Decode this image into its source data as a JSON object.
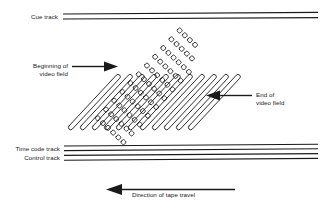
{
  "figure": {
    "type": "diagram",
    "background_color": "#ffffff",
    "line_color": "#1a1a1a"
  },
  "labels": {
    "cue_track": "Cue track",
    "beginning_of_video_field_line1": "Beginning of",
    "beginning_of_video_field_line2": "video field",
    "end_of_video_field_line1": "End of",
    "end_of_video_field_line2": "video field",
    "time_code_track": "Time code track",
    "control_track": "Control track",
    "direction_of_tape_travel": "Direction of tape travel"
  },
  "tracks": {
    "cue_track_lines": 2,
    "time_code_track_lines": 2,
    "control_track_lines": 2,
    "video_track_count": 11,
    "segment_rows": 6
  },
  "arrows": {
    "beginning_arrow": "arrow-right",
    "end_arrow": "arrow-left",
    "tape_travel_arrow": "arrow-left"
  },
  "colors": {
    "ink": "#1a1a1a",
    "paper": "#ffffff"
  }
}
